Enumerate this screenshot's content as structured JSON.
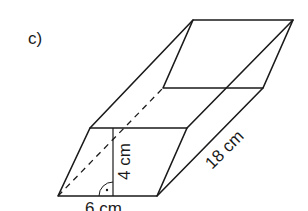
{
  "figure": {
    "label": "c)",
    "shape": "oblique prism with parallelogram cross-section",
    "dimensions": {
      "base": "6 cm",
      "height": "4 cm",
      "length": "18 cm"
    },
    "colors": {
      "stroke": "#1a1a1a",
      "background": "#ffffff"
    },
    "vertices": {
      "front_top_left": [
        90,
        128
      ],
      "front_top_right": [
        187,
        128
      ],
      "front_bottom_right": [
        157,
        196
      ],
      "front_bottom_left": [
        58,
        196
      ],
      "back_top_left": [
        193,
        20
      ],
      "back_top_right": [
        293,
        20
      ],
      "back_bottom_right": [
        263,
        88
      ],
      "back_bottom_left": [
        163,
        88
      ]
    },
    "right_angle_marker": "dot-in-arc"
  }
}
